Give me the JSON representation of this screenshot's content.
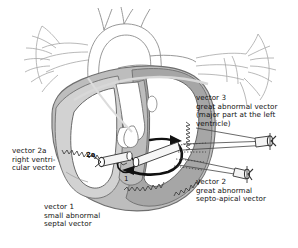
{
  "figure": {
    "background": "#ffffff"
  },
  "colors": {
    "myocardium_dark": "#a6a6a6",
    "myocardium_mid": "#bdbdbd",
    "myocardium_light": "#d2d2d2",
    "chamber_white": "#ffffff",
    "outline": "#6e6e6e",
    "outline_dark": "#4a4a4a",
    "vessel_line": "#9a9a9a",
    "arrow_black": "#111111",
    "arrow_fill": "#f2f2f2",
    "leader_line": "#555555",
    "text": "#111111"
  },
  "labels": {
    "vector3": {
      "lines": [
        "vector 3",
        "great abnormal vector",
        "(major part at the left",
        "ventricle)"
      ],
      "text": "vector 3\ngreat abnormal vector\n(major part at the left\nventricle)"
    },
    "vector2": {
      "lines": [
        "vector 2",
        "great abnormal",
        "septo-apical vector"
      ],
      "text": "vector 2\ngreat abnormal\nsepto-apical vector"
    },
    "vector2a": {
      "lines": [
        "vector 2a",
        "right ventri-",
        "cular vector"
      ],
      "text": "vector 2a\nright ventri-\ncular vector"
    },
    "vector1": {
      "lines": [
        "vector 1",
        "small abnormal",
        "septal vector"
      ],
      "text": "vector 1\nsmall abnormal\nseptal vector"
    }
  },
  "markers": {
    "marker_2a": "2a",
    "marker_1": "1"
  },
  "vectors": [
    {
      "id": "1",
      "name": "small abnormal septal vector",
      "marker": "1",
      "style": "thick-black-curved-arrow"
    },
    {
      "id": "2",
      "name": "great abnormal septo-apical vector",
      "marker": "",
      "style": "3d-cylinder-arrow-lower-right"
    },
    {
      "id": "2a",
      "name": "right ventricular vector",
      "marker": "2a",
      "style": "3d-cylinder-arrow-left"
    },
    {
      "id": "3",
      "name": "great abnormal vector",
      "marker": "",
      "style": "3d-cylinder-arrow-upper-right"
    }
  ]
}
